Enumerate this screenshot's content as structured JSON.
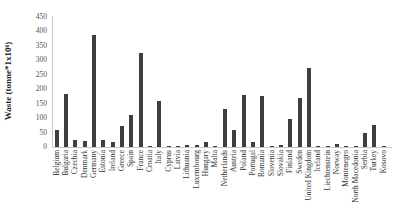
{
  "chart_data": {
    "type": "bar",
    "title": "",
    "xlabel": "",
    "ylabel": "Waste (tonne*1x10⁶)",
    "ylim": [
      0,
      450
    ],
    "yticks": [
      0,
      50,
      100,
      150,
      200,
      250,
      300,
      350,
      400,
      450
    ],
    "grid": false,
    "legend": null,
    "bar_color": "#3f3f3f",
    "categories": [
      "Belgium",
      "Bulgaria",
      "Czechia",
      "Denmark",
      "Germany",
      "Estonia",
      "Ireland",
      "Greece",
      "Spain",
      "France",
      "Croatia",
      "Italy",
      "Cyprus",
      "Latvia",
      "Lithuania",
      "Luxembourg",
      "Hungary",
      "Malta",
      "Netherlands",
      "Austria",
      "Poland",
      "Portugal",
      "Romania",
      "Slovenia",
      "Slovakia",
      "Finland",
      "Sweden",
      "United Kingdom",
      "Iceland",
      "Liechtenstein",
      "Norway",
      "Montenegro",
      "North Macedonia",
      "Serbia",
      "Turkey",
      "Kosovo"
    ],
    "values": [
      60,
      182,
      26,
      22,
      388,
      24,
      18,
      72,
      112,
      325,
      4,
      160,
      3,
      3,
      7,
      7,
      18,
      2,
      132,
      58,
      180,
      16,
      177,
      4,
      8,
      98,
      168,
      272,
      2,
      1,
      12,
      1,
      3,
      50,
      75,
      1
    ]
  }
}
